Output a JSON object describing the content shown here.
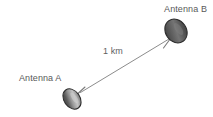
{
  "figure": {
    "type": "technical-diagram",
    "background_color": "#ffffff",
    "width": 213,
    "height": 117
  },
  "labels": {
    "antenna_b": "Antenna B",
    "antenna_a": "Antenna A",
    "distance": "1 km"
  },
  "nodes": [
    {
      "id": "antenna-b",
      "label": "Antenna B",
      "dish_center": {
        "x": 176,
        "y": 31
      },
      "dish_rx": 11,
      "dish_ry": 13,
      "dish_rotation_deg": -35,
      "mast_from": {
        "x": 176,
        "y": 31
      },
      "mast_to": {
        "x": 164,
        "y": 47
      }
    },
    {
      "id": "antenna-a",
      "label": "Antenna A",
      "dish_center": {
        "x": 72,
        "y": 99
      },
      "dish_rx": 8,
      "dish_ry": 11,
      "dish_rotation_deg": -35,
      "mast_from": {
        "x": 72,
        "y": 99
      },
      "mast_to": {
        "x": 84,
        "y": 88
      }
    }
  ],
  "link": {
    "label": "1 km",
    "from": {
      "x": 80,
      "y": 92
    },
    "to": {
      "x": 169,
      "y": 39
    },
    "stroke": "#8c8c8c",
    "stroke_width": 1
  },
  "colors": {
    "dish_fill_dark": "#3f3f3f",
    "dish_fill_mid": "#6e6e6e",
    "dish_fill_light": "#bcbcbc",
    "dish_stroke": "#2e2e2e",
    "mast_stroke": "#7a7a7a",
    "link_stroke": "#8c8c8c",
    "text": "#595959",
    "background": "#ffffff"
  }
}
